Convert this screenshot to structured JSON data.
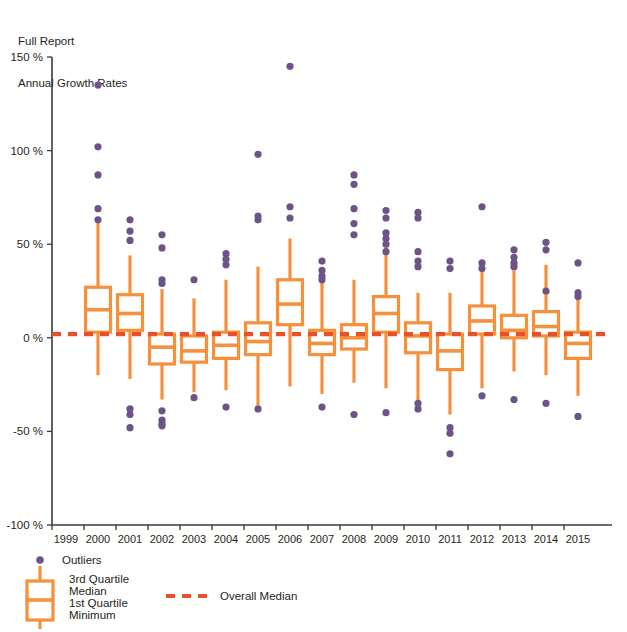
{
  "header": {
    "title_line1": "Full Report",
    "title_line2": "Annual Growth Rates"
  },
  "legend": {
    "outliers_label": "Outliers",
    "q3_label": "3rd Quartile",
    "median_label": "Median",
    "q1_label": "1st Quartile",
    "min_label": "Minimum",
    "overall_median_label": "Overall Median"
  },
  "colors": {
    "box": "#F5903C",
    "outlier": "#6E5389",
    "overall_median": "#E8502A",
    "axis": "#3A3A3A",
    "text": "#231F20"
  },
  "chart_data": {
    "type": "box",
    "title": "Annual Growth Rates",
    "subtitle": "Full Report",
    "xlabel": "",
    "ylabel": "",
    "ylim": [
      -100,
      150
    ],
    "yticks": [
      150,
      100,
      50,
      0,
      -50,
      -100
    ],
    "ytick_labels": [
      "150 %",
      "100 %",
      "50 %",
      "0 %",
      "-50 %",
      "-100 %"
    ],
    "grid": false,
    "legend_position": "below-axis-left",
    "overall_median": 2,
    "categories": [
      "1999",
      "2000",
      "2001",
      "2002",
      "2003",
      "2004",
      "2005",
      "2006",
      "2007",
      "2008",
      "2009",
      "2010",
      "2011",
      "2012",
      "2013",
      "2014",
      "2015"
    ],
    "boxes": [
      {
        "year": "1999",
        "min": null,
        "q1": null,
        "median": null,
        "q3": null,
        "max": null,
        "outliers": []
      },
      {
        "year": "2000",
        "min": -20,
        "q1": 3,
        "median": 15,
        "q3": 27,
        "max": 62,
        "outliers": [
          135,
          102,
          87,
          69,
          63
        ]
      },
      {
        "year": "2001",
        "min": -22,
        "q1": 4,
        "median": 13,
        "q3": 23,
        "max": 44,
        "outliers": [
          63,
          57,
          52,
          -38,
          -41,
          -48
        ]
      },
      {
        "year": "2002",
        "min": -33,
        "q1": -14,
        "median": -5,
        "q3": 2,
        "max": 26,
        "outliers": [
          55,
          48,
          31,
          29,
          -39,
          -44,
          -46,
          -47
        ]
      },
      {
        "year": "2003",
        "min": -29,
        "q1": -13,
        "median": -7,
        "q3": 1,
        "max": 21,
        "outliers": [
          31,
          -32
        ]
      },
      {
        "year": "2004",
        "min": -28,
        "q1": -11,
        "median": -4,
        "q3": 3,
        "max": 31,
        "outliers": [
          45,
          42,
          39,
          -37
        ]
      },
      {
        "year": "2005",
        "min": -36,
        "q1": -9,
        "median": -2,
        "q3": 8,
        "max": 38,
        "outliers": [
          98,
          65,
          63,
          -38
        ]
      },
      {
        "year": "2006",
        "min": -26,
        "q1": 7,
        "median": 18,
        "q3": 31,
        "max": 53,
        "outliers": [
          145,
          70,
          64
        ]
      },
      {
        "year": "2007",
        "min": -30,
        "q1": -9,
        "median": -3,
        "q3": 4,
        "max": 30,
        "outliers": [
          41,
          36,
          33,
          31,
          -37
        ]
      },
      {
        "year": "2008",
        "min": -24,
        "q1": -6,
        "median": 0,
        "q3": 7,
        "max": 31,
        "outliers": [
          87,
          82,
          69,
          61,
          55,
          -41
        ]
      },
      {
        "year": "2009",
        "min": -27,
        "q1": 3,
        "median": 13,
        "q3": 22,
        "max": 49,
        "outliers": [
          68,
          64,
          56,
          53,
          50,
          46,
          -40
        ]
      },
      {
        "year": "2010",
        "min": -34,
        "q1": -8,
        "median": 1,
        "q3": 8,
        "max": 24,
        "outliers": [
          67,
          64,
          46,
          41,
          38,
          -35,
          -38
        ]
      },
      {
        "year": "2011",
        "min": -41,
        "q1": -17,
        "median": -7,
        "q3": 2,
        "max": 24,
        "outliers": [
          41,
          37,
          -48,
          -51,
          -62
        ]
      },
      {
        "year": "2012",
        "min": -27,
        "q1": 2,
        "median": 9,
        "q3": 17,
        "max": 40,
        "outliers": [
          70,
          40,
          37,
          -31
        ]
      },
      {
        "year": "2013",
        "min": -18,
        "q1": 0,
        "median": 4,
        "q3": 12,
        "max": 36,
        "outliers": [
          47,
          43,
          40,
          38,
          -33
        ]
      },
      {
        "year": "2014",
        "min": -20,
        "q1": 1,
        "median": 6,
        "q3": 14,
        "max": 39,
        "outliers": [
          51,
          47,
          25,
          -35
        ]
      },
      {
        "year": "2015",
        "min": -31,
        "q1": -11,
        "median": -3,
        "q3": 3,
        "max": 26,
        "outliers": [
          40,
          24,
          22,
          -42
        ]
      }
    ]
  }
}
